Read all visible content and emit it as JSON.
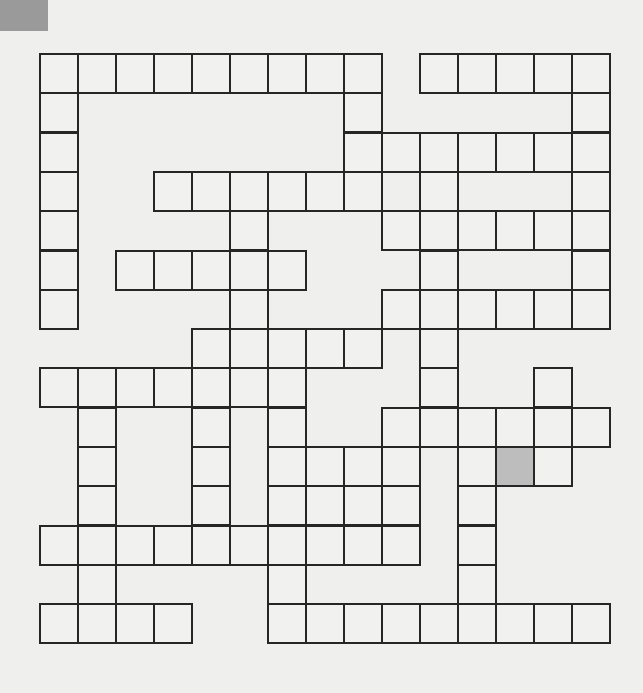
{
  "puzzle": {
    "rows": 15,
    "cols": 15,
    "cell_width": 38,
    "cell_height": 39.3,
    "colors": {
      "background": "#efefed",
      "cell": "#f1f1ef",
      "border": "#262626",
      "shaded_cell": "#bdbdbd",
      "corner_tab": "#9a9a9a"
    },
    "white_cells_by_row": [
      [
        0,
        1,
        2,
        3,
        4,
        5,
        6,
        7,
        8,
        10,
        11,
        12,
        13,
        14
      ],
      [
        0,
        8,
        14
      ],
      [
        0,
        8,
        9,
        10,
        11,
        12,
        13,
        14
      ],
      [
        0,
        3,
        4,
        5,
        6,
        7,
        8,
        10,
        14
      ],
      [
        0,
        5,
        9,
        10,
        11,
        12,
        13,
        14
      ],
      [
        0,
        2,
        3,
        4,
        5,
        6,
        10,
        14
      ],
      [
        0,
        5,
        9,
        10,
        11,
        12,
        13,
        14
      ],
      [
        4,
        5,
        6,
        7,
        8,
        10
      ],
      [
        0,
        1,
        2,
        3,
        4,
        5,
        6,
        10,
        13
      ],
      [
        1,
        4,
        6,
        9,
        10,
        11,
        12,
        13,
        14
      ],
      [
        1,
        4,
        6,
        7,
        8,
        9,
        11,
        12,
        13
      ],
      [
        1,
        4,
        6,
        7,
        8,
        9,
        11
      ],
      [
        0,
        1,
        2,
        3,
        4,
        5,
        6,
        7,
        8,
        9,
        11
      ],
      [
        1,
        6,
        11
      ],
      [
        0,
        1,
        2,
        3,
        6,
        7,
        8,
        9,
        10,
        11,
        12,
        13,
        14
      ]
    ],
    "shaded_cells": [
      [
        10,
        12
      ]
    ]
  }
}
